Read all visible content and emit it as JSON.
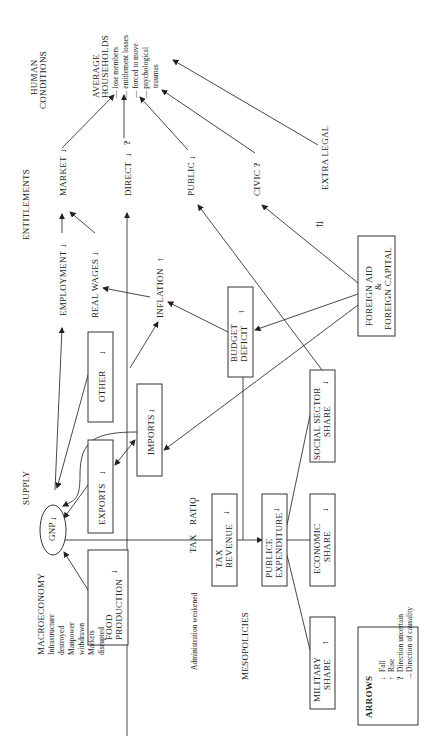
{
  "diagram": {
    "orientation": "rotated 90deg counter-clockwise",
    "columns": {
      "supply": "SUPPLY",
      "entitlements": "ENTITLEMENTS",
      "human_conditions_1": "HUMAN",
      "human_conditions_2": "CONDITIONS"
    },
    "macro": {
      "title": "MACROECONOMY",
      "lines": [
        "Infrastructure",
        "destroyed",
        "Manpower",
        "withdrawn",
        "Markets",
        "disrupted"
      ]
    },
    "admin": "Administration weakened",
    "mesopolicies": "MESOPOLICIES",
    "nodes": {
      "gnp": "GNP",
      "food_1": "FOOD",
      "food_2": "PRODUCTION",
      "exports": "EXPORTS",
      "other": "OTHER",
      "imports": "IMPORTS",
      "employment": "EMPLOYMENT",
      "real_wages": "REAL WAGES",
      "inflation": "INFLATION",
      "budget_1": "BUDGET",
      "budget_2": "DEFICIT",
      "tax": "TAX",
      "ratio": "RATIO",
      "tax_rev_1": "TAX",
      "tax_rev_2": "REVENUE",
      "pub_1": "PUBLICE",
      "pub_2": "EXPENDITURE",
      "military_1": "MILITARY",
      "military_2": "SHARE",
      "economic_1": "ECONOMIC",
      "economic_2": "SHARE",
      "social_1": "SOCIAL SECTOR",
      "social_2": "SHARE",
      "foreign_1": "FOREIGN AID",
      "foreign_2": "&",
      "foreign_3": "FOREIGN CAPITAL",
      "market": "MARKET",
      "direct": "DIRECT",
      "public": "PUBLIC",
      "civic": "CIVIC",
      "extra_legal": "EXTRA LEGAL"
    },
    "households": {
      "title_1": "AVERAGE",
      "title_2": "HOUSEHOLDS",
      "items": [
        "— lose members",
        "— entitlement losses",
        "— forced to move",
        "— psychological",
        "traumas"
      ]
    },
    "symbols": {
      "fall": "↓",
      "rise": "↑",
      "uncertain": "?"
    },
    "legend": {
      "title": "ARROWS",
      "items": [
        {
          "symbol": "↓",
          "label": "Fall"
        },
        {
          "symbol": "↑",
          "label": "Rise"
        },
        {
          "symbol": "?",
          "label": "Direction uncertain"
        },
        {
          "symbol": "→",
          "label": "Direction of causality"
        }
      ]
    }
  }
}
